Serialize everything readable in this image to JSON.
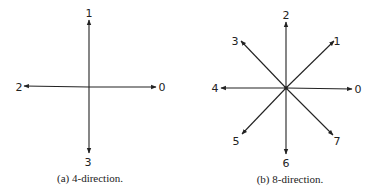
{
  "figure_a": {
    "caption": "(a) 4-direction.",
    "center": [
      89,
      87
    ],
    "directions": [
      {
        "label": "0",
        "end": [
          156,
          87
        ],
        "label_pos": [
          162,
          91
        ]
      },
      {
        "label": "1",
        "end": [
          89,
          20
        ],
        "label_pos": [
          89,
          17
        ]
      },
      {
        "label": "2",
        "end": [
          24,
          86
        ],
        "label_pos": [
          19,
          91
        ]
      },
      {
        "label": "3",
        "end": [
          89,
          153
        ],
        "label_pos": [
          88,
          166
        ]
      }
    ]
  },
  "figure_b": {
    "caption": "(b) 8-direction.",
    "center": [
      286,
      88
    ],
    "directions": [
      {
        "label": "0",
        "end": [
          352,
          89
        ],
        "label_pos": [
          358,
          93
        ]
      },
      {
        "label": "1",
        "end": [
          334,
          41
        ],
        "label_pos": [
          337,
          45
        ]
      },
      {
        "label": "2",
        "end": [
          286,
          22
        ],
        "label_pos": [
          286,
          19
        ]
      },
      {
        "label": "3",
        "end": [
          241,
          41
        ],
        "label_pos": [
          235,
          45
        ]
      },
      {
        "label": "4",
        "end": [
          221,
          88
        ],
        "label_pos": [
          215,
          92
        ]
      },
      {
        "label": "5",
        "end": [
          242,
          134
        ],
        "label_pos": [
          236,
          145
        ]
      },
      {
        "label": "6",
        "end": [
          286,
          154
        ],
        "label_pos": [
          286,
          167
        ]
      },
      {
        "label": "7",
        "end": [
          333,
          135
        ],
        "label_pos": [
          337,
          145
        ]
      }
    ]
  },
  "colors": {
    "stroke": "#222222",
    "background": "#ffffff"
  }
}
